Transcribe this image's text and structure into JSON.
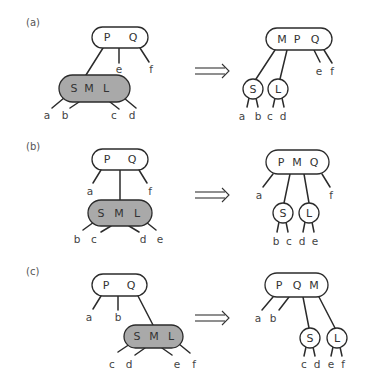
{
  "figure": {
    "panels": [
      {
        "label": "(a)",
        "label_pos": [
          26,
          22
        ],
        "arrow": {
          "x1": 195,
          "x2": 229,
          "y": 71
        },
        "before": {
          "parent": {
            "keys": [
              "P",
              "Q"
            ],
            "x": 92,
            "y": 27,
            "w": 56,
            "h": 21,
            "key_x": [
              107,
              133
            ]
          },
          "promoted": {
            "keys": [
              "S",
              "M",
              "L"
            ],
            "x": 59,
            "y": 75,
            "w": 71,
            "h": 27,
            "key_x": [
              74,
              89,
              106
            ]
          },
          "edges": [
            {
              "x1": 103,
              "y1": 48,
              "x2": 86,
              "y2": 75
            },
            {
              "x1": 119,
              "y1": 48,
              "x2": 119,
              "y2": 63
            },
            {
              "x1": 140,
              "y1": 48,
              "x2": 149,
              "y2": 62
            },
            {
              "x1": 64,
              "y1": 98,
              "x2": 52,
              "y2": 108
            },
            {
              "x1": 79,
              "y1": 102,
              "x2": 70,
              "y2": 108
            },
            {
              "x1": 110,
              "y1": 102,
              "x2": 119,
              "y2": 109
            },
            {
              "x1": 124,
              "y1": 98,
              "x2": 136,
              "y2": 108
            }
          ],
          "leaves": [
            {
              "text": "e",
              "x": 119,
              "y": 69
            },
            {
              "text": "f",
              "x": 151,
              "y": 69
            },
            {
              "text": "a",
              "x": 47,
              "y": 115
            },
            {
              "text": "b",
              "x": 65,
              "y": 115
            },
            {
              "text": "c",
              "x": 114,
              "y": 115
            },
            {
              "text": "d",
              "x": 132,
              "y": 115
            }
          ]
        },
        "after": {
          "parent": {
            "keys": [
              "M",
              "P",
              "Q"
            ],
            "x": 266,
            "y": 28,
            "w": 66,
            "h": 22,
            "key_x": [
              282,
              297,
              315
            ]
          },
          "children": [
            {
              "key": "S",
              "cx": 253,
              "cy": 89,
              "r": 10
            },
            {
              "key": "L",
              "cx": 278,
              "cy": 89,
              "r": 10
            }
          ],
          "edges": [
            {
              "x1": 275,
              "y1": 50,
              "x2": 256,
              "y2": 79
            },
            {
              "x1": 287,
              "y1": 50,
              "x2": 280,
              "y2": 79
            },
            {
              "x1": 314,
              "y1": 50,
              "x2": 320,
              "y2": 62
            },
            {
              "x1": 324,
              "y1": 50,
              "x2": 332,
              "y2": 63
            },
            {
              "x1": 249,
              "y1": 98,
              "x2": 247,
              "y2": 107
            },
            {
              "x1": 256,
              "y1": 98,
              "x2": 258,
              "y2": 107
            },
            {
              "x1": 275,
              "y1": 98,
              "x2": 273,
              "y2": 107
            },
            {
              "x1": 282,
              "y1": 98,
              "x2": 284,
              "y2": 107
            }
          ],
          "leaves": [
            {
              "text": "e",
              "x": 319,
              "y": 71
            },
            {
              "text": "f",
              "x": 332,
              "y": 71
            },
            {
              "text": "a",
              "x": 242,
              "y": 116
            },
            {
              "text": "b",
              "x": 258,
              "y": 116
            },
            {
              "text": "c",
              "x": 270,
              "y": 116
            },
            {
              "text": "d",
              "x": 283,
              "y": 116
            }
          ]
        }
      },
      {
        "label": "(b)",
        "label_pos": [
          26,
          146
        ],
        "arrow": {
          "x1": 195,
          "x2": 229,
          "y": 195
        },
        "before": {
          "parent": {
            "keys": [
              "P",
              "Q"
            ],
            "x": 92,
            "y": 149,
            "w": 56,
            "h": 21,
            "key_x": [
              107,
              132
            ]
          },
          "promoted": {
            "keys": [
              "S",
              "M",
              "L"
            ],
            "x": 88,
            "y": 200,
            "w": 64,
            "h": 26,
            "key_x": [
              101,
              119,
              137
            ]
          },
          "edges": [
            {
              "x1": 101,
              "y1": 170,
              "x2": 93,
              "y2": 183
            },
            {
              "x1": 120,
              "y1": 170,
              "x2": 120,
              "y2": 200
            },
            {
              "x1": 139,
              "y1": 170,
              "x2": 147,
              "y2": 183
            },
            {
              "x1": 94,
              "y1": 222,
              "x2": 83,
              "y2": 230
            },
            {
              "x1": 111,
              "y1": 226,
              "x2": 101,
              "y2": 232
            },
            {
              "x1": 129,
              "y1": 226,
              "x2": 139,
              "y2": 232
            },
            {
              "x1": 146,
              "y1": 222,
              "x2": 156,
              "y2": 230
            }
          ],
          "leaves": [
            {
              "text": "a",
              "x": 90,
              "y": 191
            },
            {
              "text": "f",
              "x": 150,
              "y": 191
            },
            {
              "text": "b",
              "x": 77,
              "y": 239
            },
            {
              "text": "c",
              "x": 94,
              "y": 239
            },
            {
              "text": "d",
              "x": 143,
              "y": 239
            },
            {
              "text": "e",
              "x": 160,
              "y": 239
            }
          ]
        },
        "after": {
          "parent": {
            "keys": [
              "P",
              "M",
              "Q"
            ],
            "x": 266,
            "y": 150,
            "w": 63,
            "h": 24,
            "key_x": [
              281,
              297,
              314
            ]
          },
          "children": [
            {
              "key": "S",
              "cx": 283,
              "cy": 213,
              "r": 10
            },
            {
              "key": "L",
              "cx": 309,
              "cy": 213,
              "r": 10
            }
          ],
          "edges": [
            {
              "x1": 273,
              "y1": 174,
              "x2": 263,
              "y2": 187
            },
            {
              "x1": 290,
              "y1": 174,
              "x2": 284,
              "y2": 203
            },
            {
              "x1": 304,
              "y1": 174,
              "x2": 309,
              "y2": 203
            },
            {
              "x1": 322,
              "y1": 174,
              "x2": 330,
              "y2": 187
            },
            {
              "x1": 279,
              "y1": 222,
              "x2": 277,
              "y2": 232
            },
            {
              "x1": 286,
              "y1": 222,
              "x2": 288,
              "y2": 232
            },
            {
              "x1": 305,
              "y1": 222,
              "x2": 303,
              "y2": 232
            },
            {
              "x1": 312,
              "y1": 222,
              "x2": 314,
              "y2": 232
            }
          ],
          "leaves": [
            {
              "text": "a",
              "x": 259,
              "y": 195
            },
            {
              "text": "f",
              "x": 331,
              "y": 195
            },
            {
              "text": "b",
              "x": 276,
              "y": 241
            },
            {
              "text": "c",
              "x": 289,
              "y": 241
            },
            {
              "text": "d",
              "x": 302,
              "y": 241
            },
            {
              "text": "e",
              "x": 315,
              "y": 241
            }
          ]
        }
      },
      {
        "label": "(c)",
        "label_pos": [
          26,
          271
        ],
        "arrow": {
          "x1": 195,
          "x2": 229,
          "y": 318
        },
        "before": {
          "parent": {
            "keys": [
              "P",
              "Q"
            ],
            "x": 92,
            "y": 274,
            "w": 55,
            "h": 22,
            "key_x": [
              106,
              131
            ]
          },
          "promoted": {
            "keys": [
              "S",
              "M",
              "L"
            ],
            "x": 124,
            "y": 325,
            "w": 59,
            "h": 23,
            "key_x": [
              137,
              154,
              171
            ]
          },
          "edges": [
            {
              "x1": 101,
              "y1": 296,
              "x2": 93,
              "y2": 309
            },
            {
              "x1": 118,
              "y1": 296,
              "x2": 118,
              "y2": 310
            },
            {
              "x1": 138,
              "y1": 296,
              "x2": 153,
              "y2": 325
            },
            {
              "x1": 130,
              "y1": 344,
              "x2": 118,
              "y2": 352
            },
            {
              "x1": 145,
              "y1": 348,
              "x2": 135,
              "y2": 355
            },
            {
              "x1": 162,
              "y1": 348,
              "x2": 172,
              "y2": 355
            },
            {
              "x1": 179,
              "y1": 344,
              "x2": 190,
              "y2": 353
            }
          ],
          "leaves": [
            {
              "text": "a",
              "x": 89,
              "y": 317
            },
            {
              "text": "b",
              "x": 118,
              "y": 317
            },
            {
              "text": "c",
              "x": 112,
              "y": 364
            },
            {
              "text": "d",
              "x": 129,
              "y": 364
            },
            {
              "text": "e",
              "x": 177,
              "y": 364
            },
            {
              "text": "f",
              "x": 194,
              "y": 364
            }
          ]
        },
        "after": {
          "parent": {
            "keys": [
              "P",
              "Q",
              "M"
            ],
            "x": 265,
            "y": 273,
            "w": 63,
            "h": 24,
            "key_x": [
              279,
              297,
              314
            ]
          },
          "children": [
            {
              "key": "S",
              "cx": 310,
              "cy": 338,
              "r": 10
            },
            {
              "key": "L",
              "cx": 337,
              "cy": 338,
              "r": 10
            }
          ],
          "edges": [
            {
              "x1": 273,
              "y1": 297,
              "x2": 262,
              "y2": 310
            },
            {
              "x1": 289,
              "y1": 297,
              "x2": 279,
              "y2": 310
            },
            {
              "x1": 303,
              "y1": 297,
              "x2": 309,
              "y2": 328
            },
            {
              "x1": 319,
              "y1": 297,
              "x2": 335,
              "y2": 328
            },
            {
              "x1": 306,
              "y1": 347,
              "x2": 304,
              "y2": 356
            },
            {
              "x1": 313,
              "y1": 347,
              "x2": 315,
              "y2": 356
            },
            {
              "x1": 333,
              "y1": 347,
              "x2": 331,
              "y2": 356
            },
            {
              "x1": 340,
              "y1": 347,
              "x2": 342,
              "y2": 356
            }
          ],
          "leaves": [
            {
              "text": "a",
              "x": 258,
              "y": 318
            },
            {
              "text": "b",
              "x": 273,
              "y": 318
            },
            {
              "text": "c",
              "x": 304,
              "y": 364
            },
            {
              "text": "d",
              "x": 317,
              "y": 364
            },
            {
              "text": "e",
              "x": 331,
              "y": 364
            },
            {
              "text": "f",
              "x": 343,
              "y": 364
            }
          ]
        }
      }
    ]
  },
  "colors": {
    "promoted_fill": "#a9a9a9",
    "stroke": "#2b2b2b",
    "background": "#ffffff"
  }
}
